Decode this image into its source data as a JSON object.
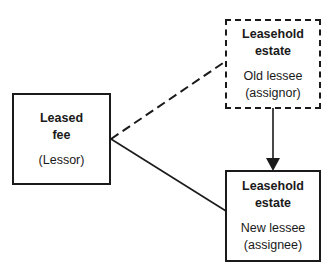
{
  "diagram": {
    "nodes": [
      {
        "id": "leased_fee",
        "title_line1": "Leased",
        "title_line2": "fee",
        "role": "(Lessor)",
        "border": "solid"
      },
      {
        "id": "old_lessee",
        "title_line1": "Leasehold",
        "title_line2": "estate",
        "role_line1": "Old lessee",
        "role_line2": "(assignor)",
        "border": "dashed"
      },
      {
        "id": "new_lessee",
        "title_line1": "Leasehold",
        "title_line2": "estate",
        "role_line1": "New lessee",
        "role_line2": "(assignee)",
        "border": "solid"
      }
    ],
    "edges": [
      {
        "from": "leased_fee",
        "to": "old_lessee",
        "style": "dashed"
      },
      {
        "from": "leased_fee",
        "to": "new_lessee",
        "style": "solid"
      },
      {
        "from": "old_lessee",
        "to": "new_lessee",
        "style": "solid-arrow"
      }
    ]
  }
}
